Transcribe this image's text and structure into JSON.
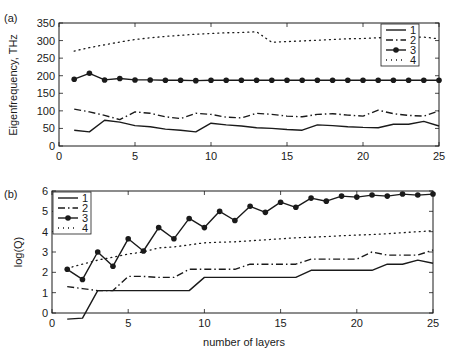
{
  "chart_data": [
    {
      "panel_label": "(a)",
      "type": "line",
      "title": "",
      "xlabel": "",
      "ylabel": "Eigenfrequency, THz",
      "xlim": [
        0,
        25
      ],
      "ylim": [
        0,
        350
      ],
      "xticks": [
        0,
        5,
        10,
        15,
        20,
        25
      ],
      "yticks": [
        0,
        50,
        100,
        150,
        200,
        250,
        300,
        350
      ],
      "grid": false,
      "legend_position": "upper right",
      "x": [
        1,
        2,
        3,
        4,
        5,
        6,
        7,
        8,
        9,
        10,
        11,
        12,
        13,
        14,
        15,
        16,
        17,
        18,
        19,
        20,
        21,
        22,
        23,
        24,
        25
      ],
      "series": [
        {
          "name": "1",
          "style": "solid",
          "values": [
            45,
            40,
            73,
            68,
            58,
            55,
            48,
            45,
            40,
            65,
            60,
            57,
            52,
            50,
            47,
            45,
            60,
            58,
            55,
            53,
            52,
            62,
            62,
            70,
            57
          ]
        },
        {
          "name": "2",
          "style": "dash-dot",
          "values": [
            105,
            97,
            87,
            75,
            97,
            93,
            83,
            78,
            93,
            90,
            82,
            80,
            93,
            90,
            85,
            83,
            90,
            92,
            88,
            85,
            102,
            92,
            87,
            85,
            100
          ]
        },
        {
          "name": "3",
          "style": "solid-marker",
          "values": [
            190,
            207,
            188,
            192,
            188,
            188,
            187,
            187,
            186,
            187,
            187,
            187,
            187,
            187,
            187,
            187,
            187,
            187,
            187,
            187,
            187,
            187,
            187,
            187,
            187
          ]
        },
        {
          "name": "4",
          "style": "dotted",
          "values": [
            270,
            280,
            288,
            296,
            303,
            308,
            312,
            315,
            318,
            320,
            322,
            323,
            325,
            295,
            297,
            299,
            301,
            303,
            305,
            306,
            308,
            309,
            310,
            310,
            305
          ]
        }
      ]
    },
    {
      "panel_label": "(b)",
      "type": "line",
      "title": "",
      "xlabel": "number of layers",
      "ylabel": "log(Q)",
      "xlim": [
        0,
        25
      ],
      "ylim": [
        0,
        6
      ],
      "xticks": [
        0,
        5,
        10,
        15,
        20,
        25
      ],
      "yticks": [
        0,
        1,
        2,
        3,
        4,
        5,
        6
      ],
      "grid": false,
      "legend_position": "upper left",
      "x": [
        1,
        2,
        3,
        4,
        5,
        6,
        7,
        8,
        9,
        10,
        11,
        12,
        13,
        14,
        15,
        16,
        17,
        18,
        19,
        20,
        21,
        22,
        23,
        24,
        25
      ],
      "series": [
        {
          "name": "1",
          "style": "solid",
          "values": [
            -0.3,
            -0.25,
            1.1,
            1.1,
            1.1,
            1.1,
            1.1,
            1.1,
            1.1,
            1.75,
            1.75,
            1.75,
            1.75,
            1.75,
            1.75,
            1.75,
            2.1,
            2.1,
            2.1,
            2.1,
            2.1,
            2.4,
            2.4,
            2.6,
            2.45
          ]
        },
        {
          "name": "2",
          "style": "dash-dot",
          "values": [
            1.3,
            1.2,
            1.1,
            1.1,
            1.8,
            1.8,
            1.75,
            1.75,
            2.15,
            2.15,
            2.15,
            2.15,
            2.4,
            2.4,
            2.4,
            2.4,
            2.65,
            2.65,
            2.65,
            2.65,
            3.0,
            2.85,
            2.85,
            2.85,
            3.1
          ]
        },
        {
          "name": "3",
          "style": "solid-marker",
          "values": [
            2.15,
            1.65,
            3.0,
            2.3,
            3.65,
            3.05,
            4.2,
            3.65,
            4.65,
            4.2,
            5.0,
            4.55,
            5.25,
            4.95,
            5.45,
            5.2,
            5.65,
            5.5,
            5.75,
            5.7,
            5.8,
            5.75,
            5.85,
            5.8,
            5.85
          ]
        },
        {
          "name": "4",
          "style": "dotted",
          "values": [
            2.2,
            2.4,
            2.6,
            2.75,
            2.9,
            3.0,
            3.2,
            3.25,
            3.35,
            3.45,
            3.48,
            3.5,
            3.55,
            3.6,
            3.65,
            3.7,
            3.73,
            3.76,
            3.8,
            3.83,
            3.86,
            3.9,
            3.95,
            4.0,
            4.05
          ]
        }
      ]
    }
  ],
  "panels": {
    "a": {
      "label": "(a)",
      "ylabel": "Eigenfrequency, THz"
    },
    "b": {
      "label": "(b)",
      "ylabel": "log(Q)",
      "xlabel": "number of layers"
    }
  },
  "legend": [
    "1",
    "2",
    "3",
    "4"
  ],
  "colors": {
    "line": "#1a1a1a",
    "background": "#ffffff",
    "axis": "#1a1a1a"
  }
}
